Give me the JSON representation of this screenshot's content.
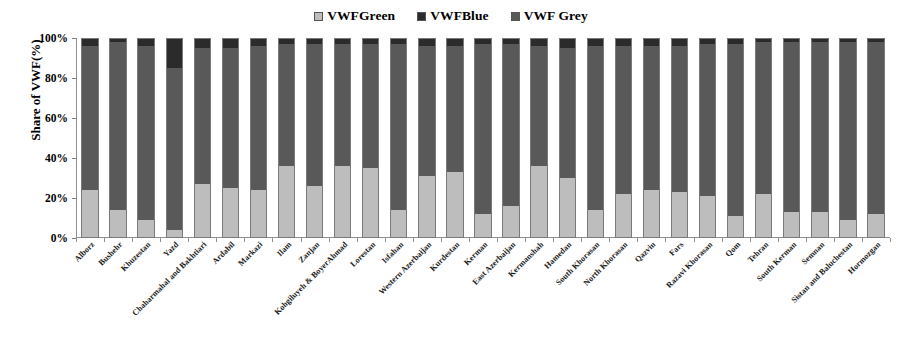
{
  "legend": {
    "position": "top-center",
    "entries": [
      {
        "label": "VWFGreen",
        "color": "#bdbdbd",
        "icon": "legend-swatch-icon"
      },
      {
        "label": "VWFBlue",
        "color": "#2b2b2b",
        "icon": "legend-swatch-icon"
      },
      {
        "label": "VWF Grey",
        "color": "#595959",
        "icon": "legend-swatch-icon"
      }
    ]
  },
  "axes": {
    "y_title": "Share of VWF(%)",
    "y_ticks": [
      "0%",
      "20%",
      "40%",
      "60%",
      "80%",
      "100%"
    ],
    "x_title": ""
  },
  "chart_data": {
    "type": "bar",
    "stacked": true,
    "title": "",
    "xlabel": "",
    "ylabel": "Share of VWF(%)",
    "ylim": [
      0,
      100
    ],
    "ytick_values": [
      0,
      20,
      40,
      60,
      80,
      100
    ],
    "grid": false,
    "legend_position": "top-center",
    "categories": [
      "Alborz",
      "Bushehr",
      "Khuzestan",
      "Yazd",
      "Chaharmahal and Bakhtiari",
      "Ardabil",
      "Markazi",
      "Ilam",
      "Zanjan",
      "Kohgiluyeh & BoyerAhmad",
      "Lorestan",
      "Isfahan",
      "Western Azerbaijan",
      "Kurdestan",
      "Kerman",
      "East Azerbaijan",
      "Kermanshah",
      "Hamedan",
      "South Khorasan",
      "North Khorasan",
      "Qazvin",
      "Fars",
      "Razavi Khorasan",
      "Qom",
      "Tehran",
      "South Kerman",
      "Semnan",
      "Sistan and Baluchestan",
      "Hormozgan"
    ],
    "series": [
      {
        "name": "VWFGreen",
        "color": "#bdbdbd",
        "values": [
          24,
          14,
          9,
          4,
          27,
          25,
          24,
          36,
          26,
          36,
          35,
          14,
          31,
          33,
          12,
          16,
          36,
          30,
          14,
          22,
          24,
          23,
          21,
          11,
          22,
          13,
          13,
          9,
          12
        ]
      },
      {
        "name": "VWF Grey",
        "color": "#595959",
        "values": [
          72,
          84,
          87,
          81,
          68,
          70,
          72,
          61,
          71,
          61,
          62,
          83,
          65,
          63,
          85,
          81,
          60,
          65,
          82,
          74,
          72,
          73,
          76,
          86,
          76,
          85,
          85,
          89,
          86
        ]
      },
      {
        "name": "VWFBlue",
        "color": "#2b2b2b",
        "values": [
          4,
          2,
          4,
          15,
          5,
          5,
          4,
          3,
          3,
          3,
          3,
          3,
          4,
          4,
          3,
          3,
          4,
          5,
          4,
          4,
          4,
          4,
          3,
          3,
          2,
          2,
          2,
          2,
          2
        ]
      }
    ]
  }
}
